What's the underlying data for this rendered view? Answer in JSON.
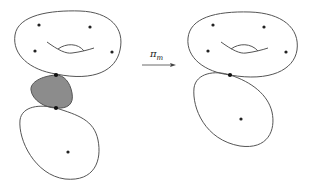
{
  "diagram": {
    "arrow": {
      "label_main": "π",
      "label_sub": "m"
    },
    "colors": {
      "stroke": "#555555",
      "shaded_component": "#8c8c8c",
      "marked_point": "#222222",
      "node": "#111111"
    },
    "left_curve": {
      "components": [
        "genus-1 surface (top)",
        "shaded rational component (middle)",
        "rational component (bottom)"
      ],
      "marked_points_top": 4,
      "marked_points_bottom": 1,
      "nodes": 2
    },
    "right_curve": {
      "components": [
        "genus-1 surface (top)",
        "rational component (bottom)"
      ],
      "marked_points_top": 4,
      "marked_points_bottom": 1,
      "nodes": 1
    }
  }
}
